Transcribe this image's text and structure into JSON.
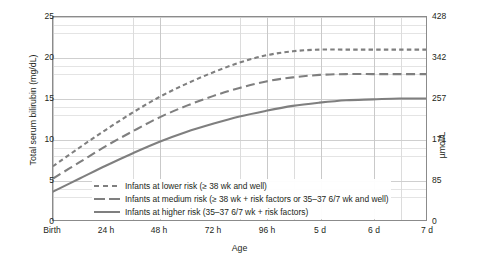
{
  "chart_data": {
    "type": "line",
    "title": "",
    "xlabel": "Age",
    "ylabel": "Total serum bilirubin (mg/dL)",
    "ylabel_right": "µmol/L",
    "grid": true,
    "legend_position": "inside lower-left",
    "xlim": [
      0,
      168
    ],
    "ylim": [
      0,
      25
    ],
    "ylim_right": [
      0,
      428
    ],
    "x_tick_labels": [
      "Birth",
      "24 h",
      "48 h",
      "72 h",
      "96 h",
      "5 d",
      "6 d",
      "7 d"
    ],
    "x_tick_hours": [
      0,
      24,
      48,
      72,
      96,
      120,
      144,
      168
    ],
    "y_tick_labels": [
      "0",
      "5",
      "10",
      "15",
      "20",
      "25"
    ],
    "y_tick_values": [
      0,
      5,
      10,
      15,
      20,
      25
    ],
    "y_tick_labels_right": [
      "0",
      "85",
      "171",
      "257",
      "342",
      "428"
    ],
    "y_tick_values_right": [
      0,
      85,
      171,
      257,
      342,
      428
    ],
    "x": [
      0,
      12,
      24,
      36,
      48,
      60,
      72,
      84,
      96,
      108,
      120,
      132,
      144,
      156,
      168
    ],
    "series": [
      {
        "name": "Infants at lower risk (≥ 38 wk and well)",
        "style": "dotted-dash",
        "color": "#7f7f7f",
        "values": [
          6.7,
          9.0,
          11.2,
          13.3,
          15.2,
          16.8,
          18.2,
          19.4,
          20.3,
          20.8,
          21.0,
          21.0,
          21.0,
          21.0,
          21.0
        ]
      },
      {
        "name": "Infants at medium risk (≥ 38 wk + risk factors or 35–37 6/7 wk and well)",
        "style": "dashed",
        "color": "#7f7f7f",
        "values": [
          5.2,
          7.2,
          9.2,
          11.0,
          12.7,
          14.1,
          15.3,
          16.3,
          17.1,
          17.6,
          17.9,
          18.0,
          18.0,
          18.0,
          18.0
        ]
      },
      {
        "name": "Infants at higher risk (35–37 6/7 wk + risk factors)",
        "style": "solid",
        "color": "#7f7f7f",
        "values": [
          3.6,
          5.2,
          6.8,
          8.3,
          9.7,
          10.9,
          11.9,
          12.8,
          13.5,
          14.1,
          14.5,
          14.8,
          14.9,
          15.0,
          15.0
        ]
      }
    ]
  },
  "legend": {
    "items": [
      {
        "label": "Infants at lower risk (≥ 38 wk and well)",
        "swatch": "dotted-dash-line-icon"
      },
      {
        "label": "Infants at medium risk (≥ 38 wk + risk factors or 35–37 6/7 wk and well)",
        "swatch": "dashed-line-icon"
      },
      {
        "label": "Infants at higher risk (35–37 6/7 wk + risk factors)",
        "swatch": "solid-line-icon"
      }
    ]
  },
  "colors": {
    "curve": "#7f7f7f",
    "frame": "#8b8b8b",
    "grid_minor": "#dcdcdc",
    "grid_major": "#c9c9c9",
    "text": "#231f20",
    "background": "#ffffff"
  }
}
